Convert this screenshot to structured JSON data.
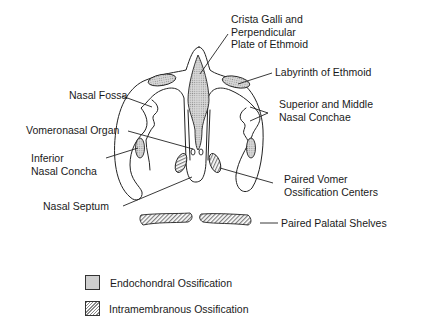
{
  "diagram": {
    "type": "anatomical coronal section",
    "labels": {
      "crista_galli": "Crista Galli and\nPerpendicular\nPlate of Ethmoid",
      "labyrinth": "Labyrinth of Ethmoid",
      "nasal_fossa": "Nasal Fossa",
      "superior_middle_conchae": "Superior and Middle\nNasal Conchae",
      "vomeronasal_organ": "Vomeronasal Organ",
      "inferior_concha": "Inferior\nNasal Concha",
      "vomer_centers": "Paired Vomer\nOssification Centers",
      "nasal_septum": "Nasal Septum",
      "palatal_shelves": "Paired Palatal Shelves"
    },
    "legend": [
      {
        "label": "Endochondral Ossification",
        "pattern": "stippled"
      },
      {
        "label": "Intramembranous Ossification",
        "pattern": "hatched"
      }
    ],
    "colors": {
      "line": "#222222",
      "endochondral_fill": "#cfcfcf",
      "intramembranous_hatch": "#8a8a8a"
    }
  }
}
